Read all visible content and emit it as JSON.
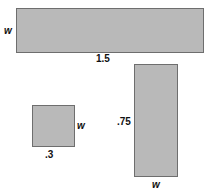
{
  "figure": {
    "background_color": "#ffffff",
    "fill_color": "#b9b9b9",
    "stroke_color": "#6e6e6e",
    "text_color": "#111111"
  },
  "shapes": [
    {
      "name": "wide-rectangle",
      "height_label": "w",
      "width_label": "1.5"
    },
    {
      "name": "small-square",
      "height_label": "w",
      "width_label": ".3"
    },
    {
      "name": "tall-rectangle",
      "height_label": ".75",
      "width_label": "w"
    }
  ],
  "chart_data": {
    "type": "diagram",
    "title": "",
    "xlabel": "",
    "ylabel": "",
    "shapes": [
      {
        "id": "wide-rectangle",
        "shape": "rectangle",
        "x": 16,
        "y": 8,
        "width_px": 188,
        "height_px": 45,
        "labels": [
          {
            "text": "w",
            "style": "italic",
            "position": "left"
          },
          {
            "text": "1.5",
            "style": "upright",
            "position": "bottom"
          }
        ]
      },
      {
        "id": "small-square",
        "shape": "square",
        "x": 32,
        "y": 105,
        "width_px": 43,
        "height_px": 42,
        "labels": [
          {
            "text": "w",
            "style": "italic",
            "position": "right"
          },
          {
            "text": ".3",
            "style": "upright",
            "position": "bottom"
          }
        ]
      },
      {
        "id": "tall-rectangle",
        "shape": "rectangle",
        "x": 134,
        "y": 64,
        "width_px": 44,
        "height_px": 113,
        "labels": [
          {
            "text": ".75",
            "style": "upright",
            "position": "left"
          },
          {
            "text": "w",
            "style": "italic",
            "position": "bottom"
          }
        ]
      }
    ]
  }
}
